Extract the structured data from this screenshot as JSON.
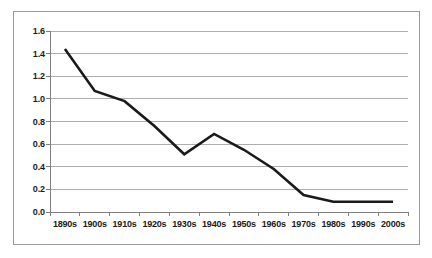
{
  "chart_data": {
    "type": "line",
    "title": "",
    "subtitle": "",
    "xlabel": "",
    "ylabel": "",
    "categories": [
      "1890s",
      "1900s",
      "1910s",
      "1920s",
      "1930s",
      "1940s",
      "1950s",
      "1960s",
      "1970s",
      "1980s",
      "1990s",
      "2000s"
    ],
    "values": [
      1.44,
      1.07,
      0.98,
      0.76,
      0.51,
      0.69,
      0.55,
      0.38,
      0.15,
      0.09,
      0.09,
      0.09
    ],
    "series": [
      {
        "name": "",
        "values": [
          1.44,
          1.07,
          0.98,
          0.76,
          0.51,
          0.69,
          0.55,
          0.38,
          0.15,
          0.09,
          0.09,
          0.09
        ]
      }
    ],
    "ylim": [
      0.0,
      1.6
    ],
    "ytick_labels": [
      "0.0",
      "0.2",
      "0.4",
      "0.6",
      "0.8",
      "1.0",
      "1.2",
      "1.4",
      "1.6"
    ],
    "ytick_values": [
      0.0,
      0.2,
      0.4,
      0.6,
      0.8,
      1.0,
      1.2,
      1.4,
      1.6
    ],
    "grid": true,
    "grid_axis": "y",
    "legend": false,
    "legend_position": "none",
    "markers": false,
    "annotations": []
  },
  "style": {
    "line_color": "#1a1a1a",
    "grid_color": "#aeaeae",
    "axis_color": "#7f7f7f",
    "border_color": "#9a9a9a",
    "background_color": "#ffffff",
    "text_color": "#1a1a1a"
  }
}
